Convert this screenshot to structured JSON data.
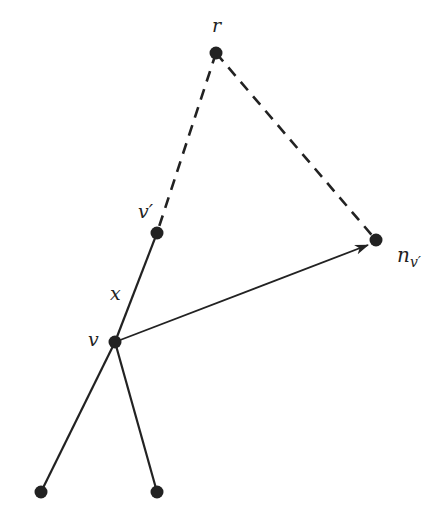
{
  "diagram": {
    "type": "tree-diagram",
    "colors": {
      "ink": "#222222",
      "background": "#ffffff"
    },
    "nodes": [
      {
        "id": "r",
        "label": "r",
        "x": 216,
        "y": 53,
        "label_x": 214,
        "label_y": 32
      },
      {
        "id": "v_prime",
        "label": "v′",
        "x": 157,
        "y": 233,
        "label_x": 139,
        "label_y": 217
      },
      {
        "id": "n_v_prime",
        "label": "n",
        "subscript": "v′",
        "x": 376,
        "y": 240,
        "label_x": 398,
        "label_y": 262
      },
      {
        "id": "v",
        "label": "v",
        "x": 115,
        "y": 342,
        "label_x": 88,
        "label_y": 346
      },
      {
        "id": "leaf_left",
        "label": "",
        "x": 41,
        "y": 492
      },
      {
        "id": "leaf_right",
        "label": "",
        "x": 157,
        "y": 492
      }
    ],
    "edges": [
      {
        "from": "r",
        "to": "v_prime",
        "style": "dashed"
      },
      {
        "from": "r",
        "to": "n_v_prime",
        "style": "dashed"
      },
      {
        "from": "v_prime",
        "to": "v",
        "style": "solid",
        "label": "x",
        "label_x": 111,
        "label_y": 299
      },
      {
        "from": "v",
        "to": "n_v_prime",
        "style": "arrow"
      },
      {
        "from": "v",
        "to": "leaf_left",
        "style": "solid"
      },
      {
        "from": "v",
        "to": "leaf_right",
        "style": "solid"
      }
    ]
  }
}
